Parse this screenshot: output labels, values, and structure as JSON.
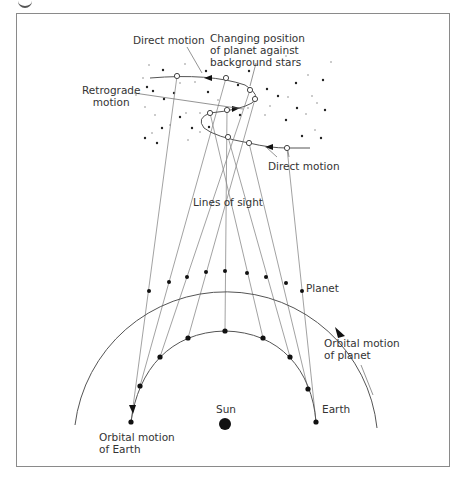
{
  "diagram": {
    "labels": {
      "direct_motion_top": "Direct motion",
      "changing_position": "Changing position\nof planet against\nbackground stars",
      "retrograde_motion": "Retrograde\nmotion",
      "direct_motion_bottom": "Direct motion",
      "lines_of_sight": "Lines of sight",
      "planet": "Planet",
      "orbital_motion_planet": "Orbital motion\nof planet",
      "sun": "Sun",
      "earth": "Earth",
      "orbital_motion_earth": "Orbital motion\nof Earth"
    },
    "colors": {
      "line": "#555555",
      "sight_line": "#8a8a8a",
      "dot": "#111111",
      "star_dark": "#222222",
      "star_light": "#bbbbbb",
      "text": "#333333"
    },
    "earth_positions": [
      [
        131,
        422
      ],
      [
        140,
        386
      ],
      [
        160,
        357
      ],
      [
        188,
        338
      ],
      [
        225,
        331
      ],
      [
        263,
        338
      ],
      [
        290,
        357
      ],
      [
        308,
        389
      ],
      [
        316,
        422
      ]
    ],
    "planet_positions": [
      [
        149,
        291
      ],
      [
        169,
        282
      ],
      [
        187,
        277
      ],
      [
        206,
        272
      ],
      [
        225,
        271
      ],
      [
        247,
        273
      ],
      [
        266,
        277
      ],
      [
        286,
        283
      ],
      [
        302,
        291
      ]
    ],
    "apparent_positions": [
      [
        177,
        76
      ],
      [
        226,
        78
      ],
      [
        250,
        90
      ],
      [
        255,
        99
      ],
      [
        227,
        110
      ],
      [
        210,
        113
      ],
      [
        228,
        137
      ],
      [
        249,
        143
      ],
      [
        287,
        148
      ]
    ],
    "sun_position": [
      225,
      424
    ]
  }
}
